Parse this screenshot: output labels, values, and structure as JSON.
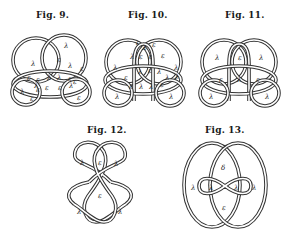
{
  "figures": [
    {
      "id": "fig9",
      "caption": "Fig. 9."
    },
    {
      "id": "fig10",
      "caption": "Fig. 10."
    },
    {
      "id": "fig11",
      "caption": "Fig. 11."
    },
    {
      "id": "fig12",
      "caption": "Fig. 12."
    },
    {
      "id": "fig13",
      "caption": "Fig. 13."
    }
  ],
  "region_symbols": {
    "lambda": "λ",
    "epsilon": "ε",
    "delta": "δ"
  },
  "fig9_labels": [
    "λ",
    "λ",
    "ε",
    "λ",
    "ε",
    "ε",
    "λ",
    "λ",
    "ε",
    "ε",
    "ε",
    "λ",
    "ε",
    "ε",
    "λ",
    "ε",
    "λ",
    "ε",
    "ε"
  ],
  "fig10_labels": [
    "ε",
    "λ",
    "ε",
    "λ",
    "ε",
    "ε",
    "ε",
    "λ",
    "λ",
    "λ",
    "ε",
    "λ",
    "ε",
    "λ",
    "ε",
    "λ",
    "λ",
    "ε",
    "λ",
    "λ",
    "λ"
  ],
  "fig11_labels": [
    "λ",
    "ε",
    "λ",
    "ε",
    "λ",
    "ε",
    "λ",
    "λ"
  ],
  "fig12_labels": [
    "λ",
    "ε",
    "λ",
    "ε",
    "λ",
    "λ"
  ],
  "fig13_labels": [
    "δ",
    "λ",
    "λ",
    "λ",
    "λ",
    "ε"
  ]
}
